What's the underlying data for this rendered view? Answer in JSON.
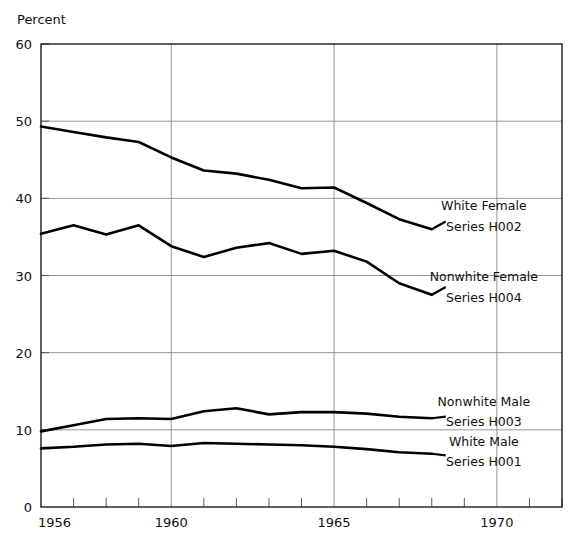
{
  "chart_data": {
    "type": "line",
    "title": "",
    "xlabel": "",
    "ylabel": "Percent",
    "xlim": [
      1956,
      1972
    ],
    "ylim": [
      0,
      60
    ],
    "yticks": [
      0,
      10,
      20,
      30,
      40,
      50,
      60
    ],
    "xticks_labeled": [
      1956,
      1960,
      1965,
      1970
    ],
    "xticks_minor": [
      1957,
      1958,
      1959,
      1961,
      1962,
      1963,
      1964,
      1966,
      1967,
      1968,
      1969,
      1971,
      1972
    ],
    "grid": true,
    "grid_axes": "both",
    "legend_position": "inline-right",
    "x": [
      1956,
      1957,
      1958,
      1959,
      1960,
      1961,
      1962,
      1963,
      1964,
      1965,
      1966,
      1967,
      1968
    ],
    "series": [
      {
        "name": "White Female",
        "code": "Series H002",
        "label_line1": "White Female",
        "label_line2": "Series H002",
        "color": "#000000",
        "values": [
          49.3,
          48.6,
          47.9,
          47.3,
          45.3,
          43.6,
          43.2,
          42.4,
          41.3,
          41.4,
          39.4,
          37.3,
          36.0
        ]
      },
      {
        "name": "Nonwhite Female",
        "code": "Series H004",
        "label_line1": "Nonwhite Female",
        "label_line2": "Series H004",
        "color": "#000000",
        "values": [
          35.4,
          36.5,
          35.3,
          36.5,
          33.8,
          32.4,
          33.6,
          34.2,
          32.8,
          33.2,
          31.8,
          29.0,
          27.5
        ]
      },
      {
        "name": "Nonwhite Male",
        "code": "Series H003",
        "label_line1": "Nonwhite Male",
        "label_line2": "Series H003",
        "color": "#000000",
        "values": [
          9.8,
          10.6,
          11.4,
          11.5,
          11.4,
          12.4,
          12.8,
          12.0,
          12.3,
          12.3,
          12.1,
          11.7,
          11.5
        ]
      },
      {
        "name": "White Male",
        "code": "Series H001",
        "label_line1": "White Male",
        "label_line2": "Series H001",
        "color": "#000000",
        "values": [
          7.6,
          7.8,
          8.1,
          8.2,
          7.9,
          8.3,
          8.2,
          8.1,
          8.0,
          7.8,
          7.5,
          7.1,
          6.9
        ]
      }
    ],
    "annotations": [
      {
        "text": "White Female",
        "x": 1969.6,
        "y": 38.5
      },
      {
        "text": "Series H002",
        "x": 1969.6,
        "y": 35.8
      },
      {
        "text": "Nonwhite Female",
        "x": 1969.6,
        "y": 29.3
      },
      {
        "text": "Series H004",
        "x": 1969.6,
        "y": 26.6
      },
      {
        "text": "Nonwhite Male",
        "x": 1969.6,
        "y": 13.1
      },
      {
        "text": "Series H003",
        "x": 1969.6,
        "y": 10.5
      },
      {
        "text": "White Male",
        "x": 1969.6,
        "y": 7.9
      },
      {
        "text": "Series H001",
        "x": 1969.6,
        "y": 5.3
      }
    ]
  },
  "labels": {
    "y_axis_title": "Percent",
    "y_ticks": [
      "60",
      "50",
      "40",
      "30",
      "20",
      "10",
      "0"
    ],
    "x_ticks": [
      "1956",
      "1960",
      "1965",
      "1970"
    ]
  },
  "legend": {
    "white_female": {
      "line1": "White Female",
      "line2": "Series H002"
    },
    "nonwhite_female": {
      "line1": "Nonwhite Female",
      "line2": "Series H004"
    },
    "nonwhite_male": {
      "line1": "Nonwhite Male",
      "line2": "Series H003"
    },
    "white_male": {
      "line1": "White Male",
      "line2": "Series H001"
    }
  },
  "colors": {
    "line": "#000000",
    "frame": "#1a1a1a",
    "grid": "#8a8a8a",
    "text": "#111111",
    "background": "#ffffff"
  }
}
